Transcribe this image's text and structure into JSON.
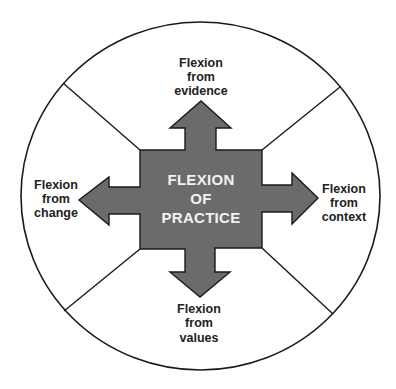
{
  "diagram": {
    "title": "Flexion of Practice",
    "colors": {
      "outline": "#1a1a1a",
      "fill": "#6b6b6b",
      "background": "#ffffff",
      "center_text": "#f2f2f2",
      "label_text": "#222222"
    },
    "center": {
      "lines": [
        "FLEXION",
        "OF",
        "PRACTICE"
      ]
    },
    "directions": [
      {
        "id": "top",
        "direction": "up",
        "lines": [
          "Flexion",
          "from",
          "evidence"
        ]
      },
      {
        "id": "right",
        "direction": "right",
        "lines": [
          "Flexion",
          "from",
          "context"
        ]
      },
      {
        "id": "bottom",
        "direction": "down",
        "lines": [
          "Flexion",
          "from",
          "values"
        ]
      },
      {
        "id": "left",
        "direction": "left",
        "lines": [
          "Flexion",
          "from",
          "change"
        ]
      }
    ]
  }
}
